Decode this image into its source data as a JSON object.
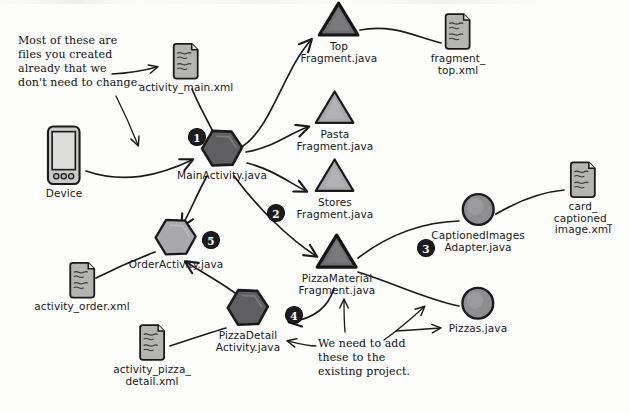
{
  "diagram": {
    "colors": {
      "stroke": "#1a1a1c",
      "dark_fill": "#5f5f61",
      "mid_fill": "#8e8e90",
      "light_fill": "#a9a9ab",
      "file_fill": "#b4b4b2",
      "badge_bg": "#1c1c1e",
      "badge_text": "#ffffff",
      "background": "#fdfdfc"
    },
    "nodes": [
      {
        "id": "activity_main_xml",
        "label": "activity_main.xml",
        "shape": "xml-file",
        "x": 186,
        "y": 68,
        "fill": "file_fill"
      },
      {
        "id": "device",
        "label": "Device",
        "shape": "device",
        "x": 64,
        "y": 162,
        "fill": "file_fill"
      },
      {
        "id": "main_activity",
        "label": "MainActivity.java",
        "shape": "hexagon",
        "x": 222,
        "y": 155,
        "fill": "dark_fill",
        "badge": "1"
      },
      {
        "id": "top_fragment",
        "label": "Top\nFragment.java",
        "shape": "triangle",
        "x": 339,
        "y": 32,
        "fill": "dark_fill"
      },
      {
        "id": "fragment_top_xml",
        "label": "fragment_\ntop.xml",
        "shape": "xml-file",
        "x": 458,
        "y": 44,
        "fill": "file_fill"
      },
      {
        "id": "pasta_fragment",
        "label": "Pasta\nFragment.java",
        "shape": "triangle",
        "x": 335,
        "y": 120,
        "fill": "light_fill"
      },
      {
        "id": "stores_fragment",
        "label": "Stores\nFragment.java",
        "shape": "triangle",
        "x": 335,
        "y": 188,
        "fill": "light_fill"
      },
      {
        "id": "pizza_material_fragment",
        "label": "PizzaMaterial\nFragment.java",
        "shape": "triangle",
        "x": 337,
        "y": 264,
        "fill": "dark_fill"
      },
      {
        "id": "captioned_images_adapter",
        "label": "CaptionedImages\nAdapter.java",
        "shape": "circle",
        "x": 478,
        "y": 222,
        "fill": "mid_fill",
        "badge": "3"
      },
      {
        "id": "card_captioned_image_xml",
        "label": "card_\ncaptioned_\nimage.xml",
        "shape": "xml-file",
        "x": 583,
        "y": 198,
        "fill": "file_fill"
      },
      {
        "id": "pizzas_java",
        "label": "Pizzas.java",
        "shape": "circle",
        "x": 478,
        "y": 310,
        "fill": "mid_fill"
      },
      {
        "id": "order_activity",
        "label": "OrderActivity.java",
        "shape": "hexagon",
        "x": 176,
        "y": 244,
        "fill": "light_fill",
        "badge": "5"
      },
      {
        "id": "activity_order_xml",
        "label": "activity_order.xml",
        "shape": "xml-file",
        "x": 82,
        "y": 287,
        "fill": "file_fill"
      },
      {
        "id": "pizza_detail_activity",
        "label": "PizzaDetail\nActivity.java",
        "shape": "hexagon",
        "x": 248,
        "y": 320,
        "fill": "dark_fill",
        "badge": "4"
      },
      {
        "id": "activity_pizza_detail_xml",
        "label": "activity_pizza_\ndetail.xml",
        "shape": "xml-file",
        "x": 152,
        "y": 355,
        "fill": "file_fill"
      }
    ],
    "badges": [
      {
        "number": "1",
        "x": 197,
        "y": 137
      },
      {
        "number": "2",
        "x": 276,
        "y": 213
      },
      {
        "number": "3",
        "x": 426,
        "y": 248
      },
      {
        "number": "4",
        "x": 294,
        "y": 315
      },
      {
        "number": "5",
        "x": 211,
        "y": 240
      }
    ],
    "annotations": [
      {
        "id": "note-existing-files",
        "text": "Most of these are\nfiles you created\nalready that we\ndon't need to change.",
        "x": 18,
        "y": 34
      },
      {
        "id": "note-add-these",
        "text": "We need to add\nthese to the\nexisting project.",
        "x": 318,
        "y": 337
      }
    ],
    "edges": [
      {
        "from": "device",
        "to": "main_activity",
        "arrow": true
      },
      {
        "from": "activity_main_xml",
        "to": "main_activity",
        "arrow": false
      },
      {
        "from": "main_activity",
        "to": "top_fragment",
        "arrow": true
      },
      {
        "from": "main_activity",
        "to": "pasta_fragment",
        "arrow": true
      },
      {
        "from": "main_activity",
        "to": "stores_fragment",
        "arrow": true
      },
      {
        "from": "top_fragment",
        "to": "fragment_top_xml",
        "arrow": false
      },
      {
        "from": "main_activity",
        "to": "pizza_material_fragment",
        "arrow": true
      },
      {
        "from": "main_activity",
        "to": "order_activity",
        "arrow": true
      },
      {
        "from": "pizza_material_fragment",
        "to": "captioned_images_adapter",
        "arrow": false
      },
      {
        "from": "captioned_images_adapter",
        "to": "card_captioned_image_xml",
        "arrow": false
      },
      {
        "from": "pizza_material_fragment",
        "to": "pizzas_java",
        "arrow": false
      },
      {
        "from": "pizza_material_fragment",
        "to": "pizza_detail_activity",
        "arrow": true
      },
      {
        "from": "pizza_detail_activity",
        "to": "order_activity",
        "arrow": true
      },
      {
        "from": "pizza_detail_activity",
        "to": "activity_pizza_detail_xml",
        "arrow": false
      },
      {
        "from": "order_activity",
        "to": "activity_order_xml",
        "arrow": false
      },
      {
        "from": "note-existing-files",
        "to": "activity_main_xml",
        "arrow": true
      },
      {
        "from": "note-existing-files",
        "to": "device",
        "arrow": true
      },
      {
        "from": "note-add-these",
        "to": "pizza_material_fragment",
        "arrow": true
      },
      {
        "from": "note-add-these",
        "to": "pizzas_java",
        "arrow": true
      },
      {
        "from": "note-add-these",
        "to": "pizza_detail_activity",
        "arrow": true
      }
    ]
  }
}
